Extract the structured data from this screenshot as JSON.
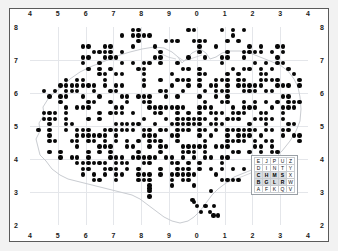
{
  "chart_data": {
    "type": "scatter",
    "title": "",
    "subtitle": "",
    "xlabel": "",
    "ylabel": "",
    "grid": true,
    "legend_position": "bottom-right",
    "xlim": [
      4,
      14
    ],
    "ylim": [
      2,
      8
    ],
    "xticks": [
      4,
      5,
      6,
      7,
      8,
      9,
      0,
      1,
      2,
      3,
      4
    ],
    "yticks": [
      8,
      7,
      6,
      5,
      4,
      3,
      2
    ],
    "xtick_labels": [
      "4",
      "5",
      "6",
      "7",
      "8",
      "9",
      "0",
      "1",
      "2",
      "3",
      "4"
    ],
    "ytick_labels": [
      "8",
      "7",
      "6",
      "5",
      "4",
      "3",
      "2"
    ],
    "axis_top_labels": [
      "4",
      "5",
      "6",
      "7",
      "8",
      "9",
      "0",
      "1",
      "2",
      "3",
      "4"
    ],
    "axis_bottom_labels": [
      "4",
      "5",
      "6",
      "7",
      "8",
      "9",
      "0",
      "1",
      "2",
      "3",
      "4"
    ],
    "axis_left_labels": [
      "8",
      "7",
      "6",
      "5",
      "4",
      "3",
      "2"
    ],
    "axis_right_labels": [
      "8",
      "7",
      "6",
      "5",
      "4",
      "3",
      "2"
    ],
    "marker": "filled-circle",
    "marker_color": "#080808",
    "marker_size_px": 4.4,
    "grid_color": "#e4e6ea",
    "coast_color": "#c9ccd1",
    "frame_color": "#5a5a5a",
    "background_color": "#ffffff",
    "page_background_color": "#f2f2f2",
    "point_count": 389,
    "points": [
      [
        48,
        189
      ],
      [
        48,
        194
      ],
      [
        53,
        189
      ],
      [
        53,
        194
      ],
      [
        58,
        189
      ],
      [
        64,
        189
      ],
      [
        69,
        189
      ],
      [
        69,
        194
      ],
      [
        75,
        189
      ],
      [
        75,
        194
      ],
      [
        80,
        184
      ],
      [
        80,
        189
      ],
      [
        86,
        178
      ],
      [
        86,
        184
      ],
      [
        91,
        178
      ],
      [
        91,
        184
      ],
      [
        91,
        189
      ],
      [
        91,
        194
      ],
      [
        97,
        173
      ],
      [
        97,
        184
      ],
      [
        97,
        194
      ],
      [
        102,
        167
      ],
      [
        102,
        173
      ],
      [
        102,
        178
      ],
      [
        102,
        184
      ],
      [
        108,
        167
      ],
      [
        108,
        173
      ],
      [
        108,
        184
      ],
      [
        113,
        167
      ],
      [
        113,
        173
      ],
      [
        113,
        178
      ],
      [
        119,
        162
      ],
      [
        119,
        167
      ],
      [
        119,
        173
      ],
      [
        124,
        162
      ],
      [
        124,
        167
      ],
      [
        124,
        173
      ],
      [
        130,
        167
      ],
      [
        130,
        173
      ],
      [
        135,
        167
      ],
      [
        141,
        162
      ],
      [
        141,
        167
      ],
      [
        146,
        167
      ],
      [
        152,
        162
      ],
      [
        157,
        162
      ],
      [
        43,
        156
      ],
      [
        48,
        156
      ],
      [
        53,
        151
      ],
      [
        53,
        156
      ],
      [
        58,
        151
      ],
      [
        58,
        156
      ],
      [
        64,
        151
      ],
      [
        64,
        156
      ],
      [
        69,
        151
      ],
      [
        75,
        145
      ],
      [
        75,
        151
      ],
      [
        80,
        145
      ],
      [
        86,
        145
      ],
      [
        91,
        140
      ],
      [
        91,
        145
      ],
      [
        97,
        140
      ],
      [
        102,
        134
      ],
      [
        102,
        140
      ],
      [
        108,
        134
      ],
      [
        113,
        129
      ],
      [
        113,
        134
      ],
      [
        119,
        129
      ],
      [
        124,
        123
      ],
      [
        124,
        129
      ],
      [
        130,
        123
      ],
      [
        135,
        118
      ],
      [
        135,
        123
      ],
      [
        141,
        118
      ],
      [
        146,
        112
      ],
      [
        152,
        112
      ],
      [
        157,
        107
      ],
      [
        163,
        107
      ],
      [
        168,
        101
      ],
      [
        174,
        101
      ],
      [
        179,
        96
      ],
      [
        185,
        96
      ],
      [
        190,
        90
      ],
      [
        196,
        90
      ],
      [
        201,
        85
      ],
      [
        207,
        85
      ],
      [
        212,
        79
      ],
      [
        218,
        79
      ],
      [
        223,
        74
      ],
      [
        229,
        74
      ],
      [
        234,
        68
      ],
      [
        240,
        68
      ],
      [
        245,
        63
      ],
      [
        251,
        63
      ],
      [
        256,
        57
      ],
      [
        262,
        57
      ],
      [
        267,
        52
      ],
      [
        273,
        52
      ]
    ],
    "note": "points array lists a representative subset in pixel coordinates relative to the plot area; the full dot field is generated on the same 10 km lattice."
  },
  "legend": {
    "name": "os-grid-letter-key",
    "rows": [
      [
        "E",
        "J",
        "P",
        "U",
        "Z"
      ],
      [
        "D",
        "I",
        "N",
        "T",
        "Y"
      ],
      [
        "C",
        "H",
        "M",
        "S",
        "X"
      ],
      [
        "B",
        "G",
        "L",
        "R",
        "W"
      ],
      [
        "A",
        "F",
        "K",
        "Q",
        "V"
      ]
    ],
    "highlighted": [
      "C",
      "H",
      "M",
      "S",
      "B",
      "G",
      "L",
      "R"
    ]
  }
}
